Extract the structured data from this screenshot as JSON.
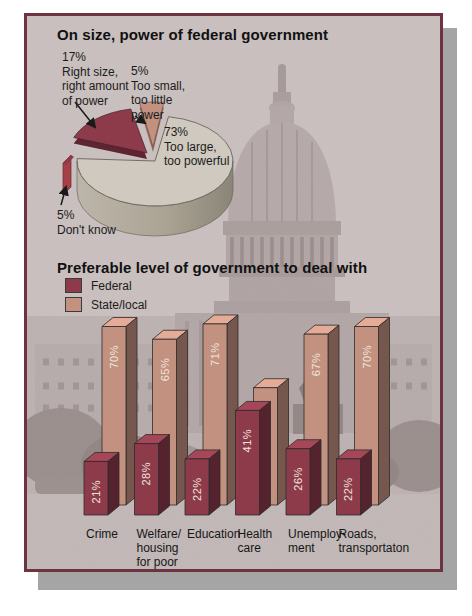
{
  "frame": {
    "page_background": "#ffffff",
    "shadow_color": "#a5a5a5",
    "border_color": "#6e3340",
    "panel_background": "#cac1c0"
  },
  "pie_section": {
    "title": "On size, power of federal government",
    "callouts": {
      "right_size": "17%\nRight size,\nright amount\nof power",
      "too_small": "5%\nToo small,\ntoo little\npower",
      "too_large": "73%\nToo large,\ntoo powerful",
      "dont_know": "5%\nDon't know"
    }
  },
  "bar_section": {
    "title": "Preferable level of government to deal with",
    "legend": [
      {
        "label": "Federal",
        "color": "#8d3b4b"
      },
      {
        "label": "State/local",
        "color": "#c39180"
      }
    ]
  },
  "chart_data": [
    {
      "type": "pie",
      "title": "On size, power of federal government",
      "unit": "%",
      "slices": [
        {
          "label": "Too large, too powerful",
          "value": 73,
          "color": "#cfc9bf"
        },
        {
          "label": "Right size, right amount of power",
          "value": 17,
          "color": "#8d3b4b"
        },
        {
          "label": "Too small, too little power",
          "value": 5,
          "color": "#c39180"
        },
        {
          "label": "Don't know",
          "value": 5,
          "color": "#a63f48"
        }
      ]
    },
    {
      "type": "bar",
      "title": "Preferable level of government to deal with",
      "unit": "%",
      "ylim": [
        0,
        100
      ],
      "grid": false,
      "legend_position": "top-left",
      "categories": [
        "Crime",
        "Welfare/\nhousing\nfor poor",
        "Education",
        "Health\ncare",
        "Unemploy-\nment",
        "Roads,\ntransportaton"
      ],
      "series": [
        {
          "name": "Federal",
          "color": "#8d3b4b",
          "values": [
            21,
            28,
            22,
            41,
            26,
            22
          ],
          "labels": [
            "21%",
            "28%",
            "22%",
            "41%",
            "26%",
            "22%"
          ]
        },
        {
          "name": "State/local",
          "color": "#c39180",
          "values": [
            70,
            65,
            71,
            46,
            67,
            70
          ],
          "labels": [
            "70%",
            "65%",
            "71%",
            "46%",
            "67%",
            "70%"
          ]
        }
      ]
    }
  ]
}
